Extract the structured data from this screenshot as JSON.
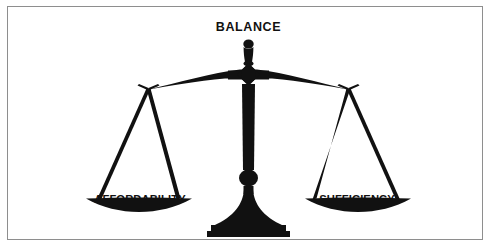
{
  "figure": {
    "kind": "balance-scale-diagram",
    "title": "BALANCE",
    "left_pan_label": "AFFORDABILITY",
    "right_pan_label": "SUFFICIENCY",
    "colors": {
      "ink": "#111111",
      "background": "#ffffff",
      "frame": "#8e8e8e"
    },
    "parts": {
      "finial": "finial-knob",
      "beam": "balance-beam",
      "pivot": "pivot-ornament",
      "column": "center-column",
      "base": "pedestal-base",
      "plinth": "base-plinth",
      "left_cords": "left-suspension-cords",
      "right_cords": "right-suspension-cords",
      "left_pan": "left-pan-dish",
      "right_pan": "right-pan-dish"
    }
  }
}
